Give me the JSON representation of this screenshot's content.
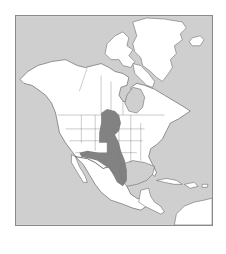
{
  "map": {
    "title": "Range map of North America",
    "region": "North America",
    "colors": {
      "ocean": "#cfcfcf",
      "land": "#ffffff",
      "range": "#7b7b7b",
      "border": "#555555",
      "frame": "#8a8a8a"
    },
    "features": {
      "landmasses": [
        "North America",
        "Greenland",
        "Iceland",
        "Caribbean islands",
        "northern South America"
      ],
      "shaded_range": "Great Plains from southern Canadian prairies south through Mexico",
      "water_bodies": [
        "Hudson Bay",
        "Gulf of Mexico",
        "Caribbean Sea",
        "Pacific Ocean",
        "Atlantic Ocean"
      ]
    }
  }
}
